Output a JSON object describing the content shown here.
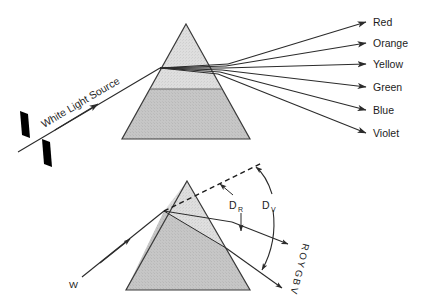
{
  "figure": {
    "background_color": "#ffffff",
    "ink_color": "#1c1c1c",
    "prism_fill_light": "#dcdcdc",
    "prism_fill_dark": "#c4c4c4",
    "prism_edge_color": "#3a3a3a"
  },
  "top_diagram": {
    "source_label": "White Light Source",
    "spectrum_labels": [
      {
        "name": "Red",
        "text": "Red"
      },
      {
        "name": "Orange",
        "text": "Orange"
      },
      {
        "name": "Yellow",
        "text": "Yellow"
      },
      {
        "name": "Green",
        "text": "Green"
      },
      {
        "name": "Blue",
        "text": "Blue"
      },
      {
        "name": "Violet",
        "text": "Violet"
      }
    ]
  },
  "bottom_diagram": {
    "incident_label": "W",
    "angle_red": {
      "base": "D",
      "sub": "R"
    },
    "angle_violet": {
      "base": "D",
      "sub": "V"
    },
    "spectrum_stack": "ROYGBV",
    "spectrum_stack_letters": [
      "R",
      "O",
      "Y",
      "G",
      "B",
      "V"
    ]
  }
}
